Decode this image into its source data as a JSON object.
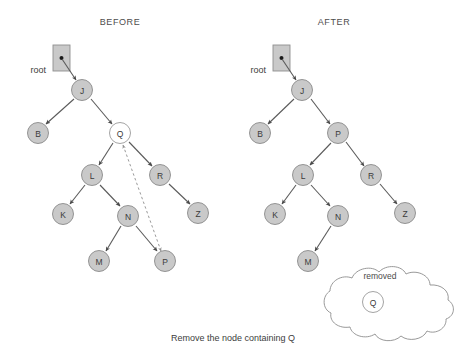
{
  "figure": {
    "caption": "Remove the node containing Q",
    "panels": [
      {
        "key": "before",
        "title": "BEFORE",
        "root_label": "root"
      },
      {
        "key": "after",
        "title": "AFTER",
        "root_label": "removed_panel_root"
      }
    ]
  },
  "before": {
    "title": "BEFORE",
    "root_label": "root",
    "nodes": [
      {
        "id": "J",
        "label": "J",
        "x": 82,
        "y": 90,
        "style": "filled"
      },
      {
        "id": "B",
        "label": "B",
        "x": 38,
        "y": 133,
        "style": "filled"
      },
      {
        "id": "Q",
        "label": "Q",
        "x": 120,
        "y": 133,
        "style": "open"
      },
      {
        "id": "L",
        "label": "L",
        "x": 92,
        "y": 175,
        "style": "filled"
      },
      {
        "id": "R",
        "label": "R",
        "x": 160,
        "y": 175,
        "style": "filled"
      },
      {
        "id": "K",
        "label": "K",
        "x": 63,
        "y": 214,
        "style": "filled"
      },
      {
        "id": "N",
        "label": "N",
        "x": 128,
        "y": 216,
        "style": "filled"
      },
      {
        "id": "Z",
        "label": "Z",
        "x": 198,
        "y": 213,
        "style": "filled"
      },
      {
        "id": "M",
        "label": "M",
        "x": 99,
        "y": 261,
        "style": "filled"
      },
      {
        "id": "P",
        "label": "P",
        "x": 165,
        "y": 261,
        "style": "filled"
      }
    ],
    "edges": [
      {
        "from": "root",
        "to": "J",
        "kind": "solid"
      },
      {
        "from": "J",
        "to": "B",
        "kind": "solid"
      },
      {
        "from": "J",
        "to": "Q",
        "kind": "solid"
      },
      {
        "from": "Q",
        "to": "L",
        "kind": "solid"
      },
      {
        "from": "Q",
        "to": "R",
        "kind": "solid"
      },
      {
        "from": "L",
        "to": "K",
        "kind": "solid"
      },
      {
        "from": "L",
        "to": "N",
        "kind": "solid"
      },
      {
        "from": "R",
        "to": "Z",
        "kind": "solid"
      },
      {
        "from": "N",
        "to": "M",
        "kind": "solid"
      },
      {
        "from": "N",
        "to": "P",
        "kind": "solid"
      },
      {
        "from": "P",
        "to": "Q",
        "kind": "dashed-bidirectional"
      }
    ],
    "root_pointer": {
      "x": 53,
      "y": 57,
      "w": 17,
      "h": 26
    }
  },
  "after": {
    "title": "AFTER",
    "root_label": "root",
    "nodes": [
      {
        "id": "J",
        "label": "J",
        "x": 302,
        "y": 90,
        "style": "filled"
      },
      {
        "id": "B",
        "label": "B",
        "x": 260,
        "y": 133,
        "style": "filled"
      },
      {
        "id": "P",
        "label": "P",
        "x": 338,
        "y": 133,
        "style": "filled"
      },
      {
        "id": "L",
        "label": "L",
        "x": 303,
        "y": 175,
        "style": "filled"
      },
      {
        "id": "R",
        "label": "R",
        "x": 371,
        "y": 175,
        "style": "filled"
      },
      {
        "id": "K",
        "label": "K",
        "x": 275,
        "y": 214,
        "style": "filled"
      },
      {
        "id": "N",
        "label": "N",
        "x": 338,
        "y": 216,
        "style": "filled"
      },
      {
        "id": "Z",
        "label": "Z",
        "x": 405,
        "y": 213,
        "style": "filled"
      },
      {
        "id": "M",
        "label": "M",
        "x": 308,
        "y": 261,
        "style": "filled"
      }
    ],
    "edges": [
      {
        "from": "root",
        "to": "J",
        "kind": "solid"
      },
      {
        "from": "J",
        "to": "B",
        "kind": "solid"
      },
      {
        "from": "J",
        "to": "P",
        "kind": "solid"
      },
      {
        "from": "P",
        "to": "L",
        "kind": "solid"
      },
      {
        "from": "P",
        "to": "R",
        "kind": "solid"
      },
      {
        "from": "L",
        "to": "K",
        "kind": "solid"
      },
      {
        "from": "L",
        "to": "N",
        "kind": "solid"
      },
      {
        "from": "R",
        "to": "Z",
        "kind": "solid"
      },
      {
        "from": "N",
        "to": "M",
        "kind": "solid"
      }
    ],
    "root_pointer": {
      "x": 273,
      "y": 57,
      "w": 17,
      "h": 26
    }
  },
  "cloud": {
    "label": "removed",
    "node": {
      "id": "Q",
      "label": "Q",
      "x": 373,
      "y": 302,
      "style": "open"
    }
  },
  "colors": {
    "node_fill": "#c9c9c9",
    "node_stroke": "#8a8a8a",
    "open_fill": "#ffffff",
    "edge": "#5a5a5a",
    "dashed_edge": "#9a9a9a",
    "text": "#3d3d3d",
    "background": "#ffffff"
  }
}
